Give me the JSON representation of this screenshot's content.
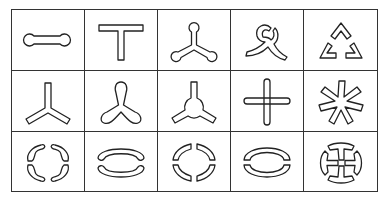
{
  "figure": {
    "type": "shape-matrix",
    "rows": 3,
    "columns": 5,
    "stroke_color": "#222222",
    "border_color": "#333333",
    "background": "#ffffff"
  },
  "cells": [
    {
      "row": 1,
      "col": 1,
      "shape": "dumbbell-horizontal"
    },
    {
      "row": 1,
      "col": 2,
      "shape": "t-shape"
    },
    {
      "row": 1,
      "col": 3,
      "shape": "three-arm-rounded-knobs"
    },
    {
      "row": 1,
      "col": 4,
      "shape": "triskelion-swirl"
    },
    {
      "row": 1,
      "col": 5,
      "shape": "broken-triangle-chevrons"
    },
    {
      "row": 2,
      "col": 1,
      "shape": "three-arm-y-straight"
    },
    {
      "row": 2,
      "col": 2,
      "shape": "three-arm-teardrop-lobes"
    },
    {
      "row": 2,
      "col": 3,
      "shape": "three-arm-with-hub-circle"
    },
    {
      "row": 2,
      "col": 4,
      "shape": "cross-rounded-bars"
    },
    {
      "row": 2,
      "col": 5,
      "shape": "asterisk-seven-arm"
    },
    {
      "row": 3,
      "col": 1,
      "shape": "four-wavy-arc-segments"
    },
    {
      "row": 3,
      "col": 2,
      "shape": "two-arc-segments-rounded"
    },
    {
      "row": 3,
      "col": 3,
      "shape": "four-arc-segments-square-ends"
    },
    {
      "row": 3,
      "col": 4,
      "shape": "two-arc-segments-square-ends"
    },
    {
      "row": 3,
      "col": 5,
      "shape": "circle-with-cross-split"
    }
  ]
}
